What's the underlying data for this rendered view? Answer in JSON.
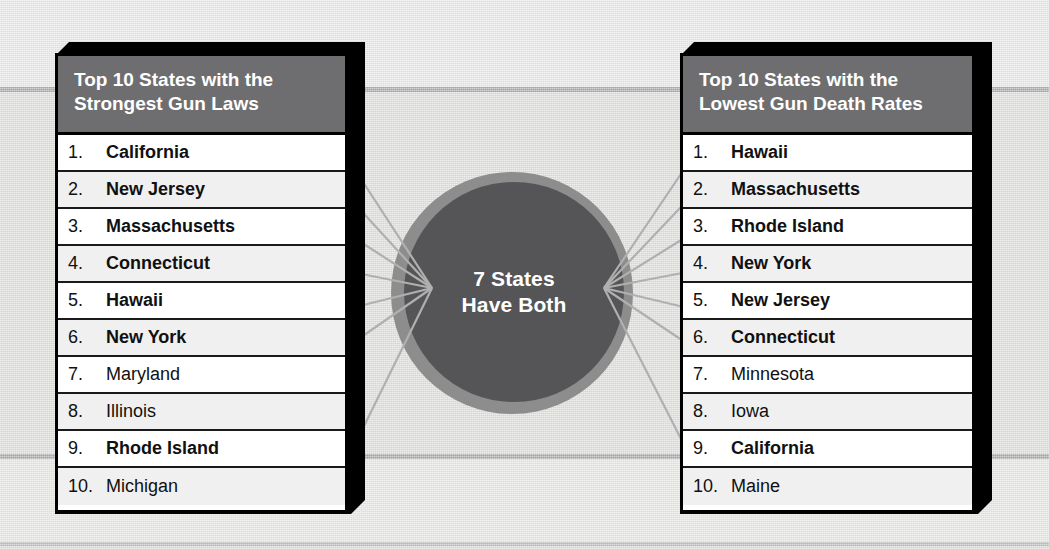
{
  "center": {
    "line1": "7 States",
    "line2": "Have Both",
    "shared_count": 7,
    "halo_color": "#8d8d8d",
    "core_color": "#555557",
    "text_color": "#ffffff"
  },
  "colors": {
    "header_bg": "#6e6e70",
    "panel_edge": "#000000",
    "row_bg": "#ffffff",
    "row_alt_bg": "#f0f0f0",
    "background": "#e2e2e2",
    "rule": "#a9a9a9",
    "connector": "#b0b0b0"
  },
  "left_panel": {
    "title_line1": "Top 10 States with the",
    "title_line2": "Strongest Gun Laws",
    "items": [
      {
        "num": "1.",
        "name": "California",
        "shared": true
      },
      {
        "num": "2.",
        "name": "New Jersey",
        "shared": true
      },
      {
        "num": "3.",
        "name": "Massachusetts",
        "shared": true
      },
      {
        "num": "4.",
        "name": "Connecticut",
        "shared": true
      },
      {
        "num": "5.",
        "name": "Hawaii",
        "shared": true
      },
      {
        "num": "6.",
        "name": "New York",
        "shared": true
      },
      {
        "num": "7.",
        "name": "Maryland",
        "shared": false
      },
      {
        "num": "8.",
        "name": "Illinois",
        "shared": false
      },
      {
        "num": "9.",
        "name": "Rhode Island",
        "shared": true
      },
      {
        "num": "10.",
        "name": "Michigan",
        "shared": false
      }
    ]
  },
  "right_panel": {
    "title_line1": "Top 10 States with the",
    "title_line2": "Lowest Gun Death Rates",
    "items": [
      {
        "num": "1.",
        "name": "Hawaii",
        "shared": true
      },
      {
        "num": "2.",
        "name": "Massachusetts",
        "shared": true
      },
      {
        "num": "3.",
        "name": "Rhode Island",
        "shared": true
      },
      {
        "num": "4.",
        "name": "New York",
        "shared": true
      },
      {
        "num": "5.",
        "name": "New Jersey",
        "shared": true
      },
      {
        "num": "6.",
        "name": "Connecticut",
        "shared": true
      },
      {
        "num": "7.",
        "name": "Minnesota",
        "shared": false
      },
      {
        "num": "8.",
        "name": "Iowa",
        "shared": false
      },
      {
        "num": "9.",
        "name": "California",
        "shared": true
      },
      {
        "num": "10.",
        "name": "Maine",
        "shared": false
      }
    ]
  },
  "connectors": {
    "left_hub_x": 432,
    "left_hub_y": 288,
    "right_hub_x": 604,
    "right_hub_y": 288,
    "left_rows": [
      1,
      2,
      3,
      4,
      5,
      6,
      9
    ],
    "right_rows": [
      1,
      2,
      3,
      4,
      5,
      6,
      9
    ]
  }
}
